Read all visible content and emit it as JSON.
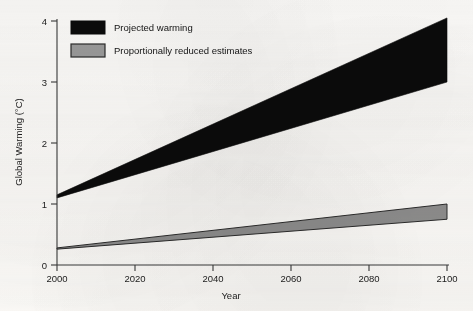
{
  "chart_data": {
    "type": "area",
    "title": "",
    "xlabel": "Year",
    "ylabel": "Global Warming (°C)",
    "xlim": [
      2000,
      2100
    ],
    "ylim": [
      0,
      4
    ],
    "xticks": [
      2000,
      2020,
      2040,
      2060,
      2080,
      2100
    ],
    "xtick_labels": [
      "2000",
      "2020",
      "2040",
      "2060",
      "2080",
      "2100"
    ],
    "yticks": [
      0,
      1,
      2,
      3,
      4
    ],
    "ytick_labels": [
      "0",
      "1",
      "2",
      "3",
      "4"
    ],
    "grid": false,
    "legend_position": "top-left",
    "series": [
      {
        "name": "Projected warming",
        "color": "#0b0b0b",
        "type": "band",
        "x": [
          2000,
          2100
        ],
        "lower": [
          1.1,
          3.0
        ],
        "upper": [
          1.15,
          4.05
        ]
      },
      {
        "name": "Proportionally reduced estimates",
        "color": "#8e8e8e",
        "edge_color": "#2b2b2b",
        "type": "band",
        "x": [
          2000,
          2100
        ],
        "lower": [
          0.26,
          0.75
        ],
        "upper": [
          0.28,
          1.0
        ]
      }
    ]
  },
  "legend": {
    "items": [
      {
        "label": "Projected warming",
        "swatch": "black-filled-rect"
      },
      {
        "label": "Proportionally reduced estimates",
        "swatch": "gray-filled-rect-dark-border"
      }
    ]
  },
  "axes": {
    "x_title": "Year",
    "y_title": "Global Warming (°C)"
  },
  "colors": {
    "projected": "#0b0b0b",
    "reduced_fill": "#8e8e8e",
    "reduced_edge": "#2b2b2b",
    "axis": "#3a3a3a",
    "paper": "#fbfaf8"
  }
}
